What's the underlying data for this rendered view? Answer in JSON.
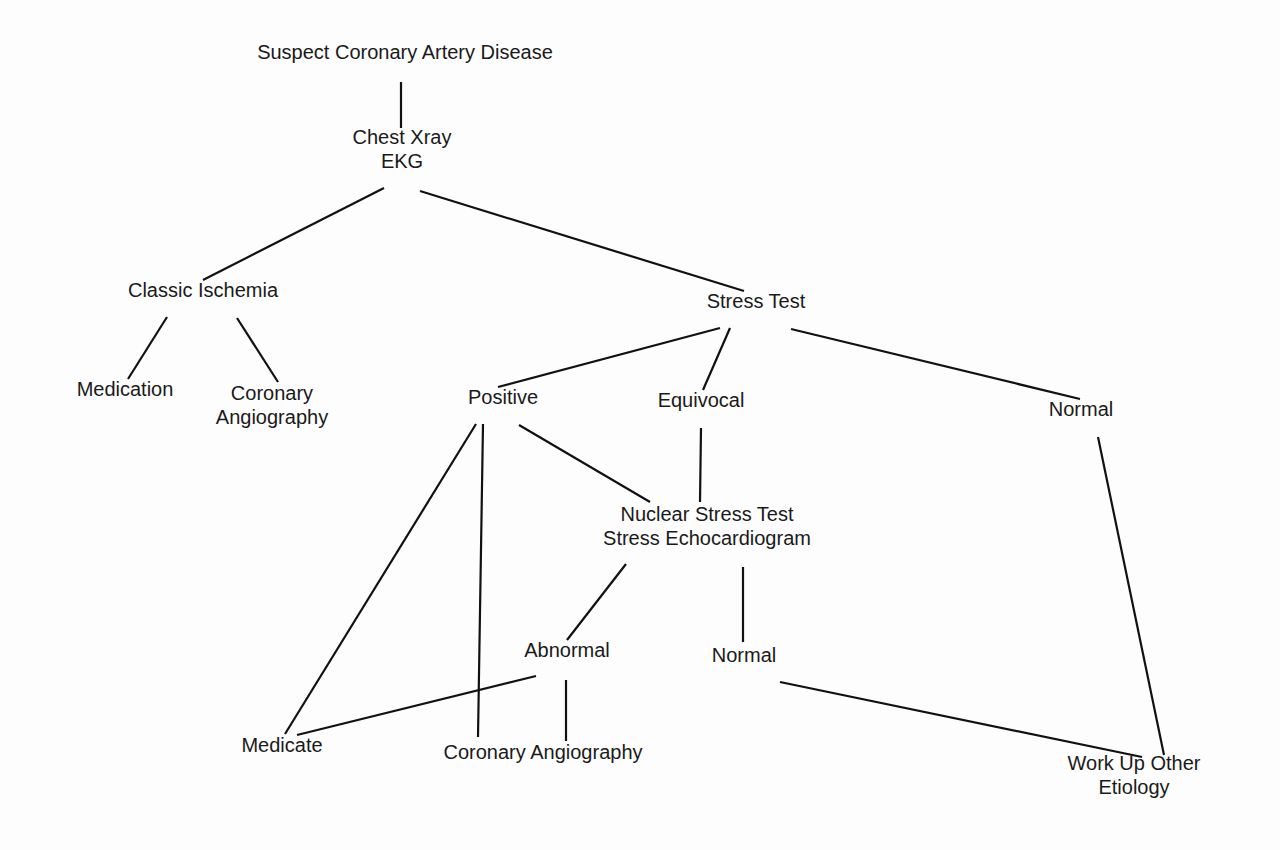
{
  "diagram": {
    "type": "flowchart-tree",
    "nodes": {
      "root": {
        "lines": [
          "Suspect Coronary Artery Disease"
        ],
        "x": 405,
        "y": 52
      },
      "cxr": {
        "lines": [
          "Chest Xray",
          "EKG"
        ],
        "x": 402,
        "y": 137
      },
      "classic": {
        "lines": [
          "Classic Ischemia"
        ],
        "x": 203,
        "y": 290
      },
      "stress": {
        "lines": [
          "Stress Test"
        ],
        "x": 756,
        "y": 301
      },
      "medication": {
        "lines": [
          "Medication"
        ],
        "x": 125,
        "y": 389
      },
      "cor_ang_1": {
        "lines": [
          "Coronary",
          "Angiography"
        ],
        "x": 272,
        "y": 393
      },
      "positive": {
        "lines": [
          "Positive"
        ],
        "x": 503,
        "y": 397
      },
      "equivocal": {
        "lines": [
          "Equivocal"
        ],
        "x": 701,
        "y": 400
      },
      "normal_1": {
        "lines": [
          "Normal"
        ],
        "x": 1081,
        "y": 409
      },
      "nuclear": {
        "lines": [
          "Nuclear Stress Test",
          "Stress Echocardiogram"
        ],
        "x": 707,
        "y": 514
      },
      "abnormal": {
        "lines": [
          "Abnormal"
        ],
        "x": 567,
        "y": 650
      },
      "normal_2": {
        "lines": [
          "Normal"
        ],
        "x": 744,
        "y": 655
      },
      "medicate": {
        "lines": [
          "Medicate"
        ],
        "x": 282,
        "y": 745
      },
      "cor_ang_2": {
        "lines": [
          "Coronary Angiography"
        ],
        "x": 543,
        "y": 752
      },
      "workup": {
        "lines": [
          "Work Up Other",
          "Etiology"
        ],
        "x": 1134,
        "y": 763
      }
    },
    "edges": [
      {
        "from": "root",
        "to": "cxr",
        "x1": 401,
        "y1": 82,
        "x2": 401,
        "y2": 128
      },
      {
        "from": "cxr",
        "to": "classic",
        "x1": 384,
        "y1": 188,
        "x2": 203,
        "y2": 280
      },
      {
        "from": "cxr",
        "to": "stress",
        "x1": 420,
        "y1": 191,
        "x2": 744,
        "y2": 291
      },
      {
        "from": "classic",
        "to": "medication",
        "x1": 167,
        "y1": 317,
        "x2": 128,
        "y2": 379
      },
      {
        "from": "classic",
        "to": "cor_ang_1",
        "x1": 237,
        "y1": 318,
        "x2": 278,
        "y2": 382
      },
      {
        "from": "stress",
        "to": "positive",
        "x1": 720,
        "y1": 328,
        "x2": 498,
        "y2": 387
      },
      {
        "from": "stress",
        "to": "equivocal",
        "x1": 730,
        "y1": 328,
        "x2": 703,
        "y2": 390
      },
      {
        "from": "stress",
        "to": "normal_1",
        "x1": 791,
        "y1": 329,
        "x2": 1080,
        "y2": 399
      },
      {
        "from": "positive",
        "to": "medicate",
        "x1": 476,
        "y1": 424,
        "x2": 285,
        "y2": 734
      },
      {
        "from": "positive",
        "to": "cor_ang_2",
        "x1": 483,
        "y1": 424,
        "x2": 478,
        "y2": 737
      },
      {
        "from": "positive",
        "to": "nuclear",
        "x1": 519,
        "y1": 425,
        "x2": 650,
        "y2": 502
      },
      {
        "from": "equivocal",
        "to": "nuclear",
        "x1": 701,
        "y1": 428,
        "x2": 700,
        "y2": 502
      },
      {
        "from": "normal_1",
        "to": "workup",
        "x1": 1098,
        "y1": 437,
        "x2": 1164,
        "y2": 755
      },
      {
        "from": "nuclear",
        "to": "abnormal",
        "x1": 626,
        "y1": 564,
        "x2": 567,
        "y2": 640
      },
      {
        "from": "nuclear",
        "to": "normal_2",
        "x1": 743,
        "y1": 567,
        "x2": 743,
        "y2": 642
      },
      {
        "from": "abnormal",
        "to": "medicate",
        "x1": 536,
        "y1": 676,
        "x2": 297,
        "y2": 735
      },
      {
        "from": "abnormal",
        "to": "cor_ang_2",
        "x1": 566,
        "y1": 680,
        "x2": 566,
        "y2": 741
      },
      {
        "from": "normal_2",
        "to": "workup",
        "x1": 780,
        "y1": 682,
        "x2": 1142,
        "y2": 757
      }
    ]
  }
}
